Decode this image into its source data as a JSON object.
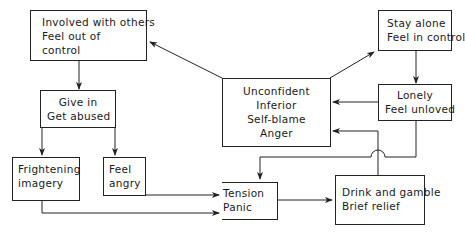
{
  "diagram": {
    "type": "flowchart",
    "nodes": {
      "involved": {
        "lines": [
          "Involved  with others",
          "Feel out of",
          "control"
        ]
      },
      "stay_alone": {
        "lines": [
          "Stay alone",
          "Feel in control"
        ]
      },
      "unconfident": {
        "lines": [
          "Unconfident",
          "Inferior",
          "Self-blame",
          "Anger"
        ]
      },
      "give_in": {
        "lines": [
          "Give in",
          "Get abused"
        ]
      },
      "lonely": {
        "lines": [
          "Lonely",
          "Feel unloved"
        ]
      },
      "frightening": {
        "lines": [
          "Frightening",
          "imagery"
        ]
      },
      "feel_angry": {
        "lines": [
          "Feel",
          "angry"
        ]
      },
      "tension": {
        "lines": [
          "Tension",
          "Panic"
        ]
      },
      "drink": {
        "lines": [
          "Drink and gamble",
          "Brief relief"
        ]
      }
    },
    "edges": [
      [
        "unconfident",
        "involved"
      ],
      [
        "unconfident",
        "stay_alone"
      ],
      [
        "involved",
        "give_in"
      ],
      [
        "stay_alone",
        "lonely"
      ],
      [
        "lonely",
        "unconfident"
      ],
      [
        "give_in",
        "frightening"
      ],
      [
        "give_in",
        "feel_angry"
      ],
      [
        "feel_angry",
        "tension"
      ],
      [
        "frightening",
        "tension"
      ],
      [
        "tension",
        "drink"
      ],
      [
        "drink",
        "unconfident"
      ],
      [
        "lonely",
        "tension"
      ]
    ]
  }
}
